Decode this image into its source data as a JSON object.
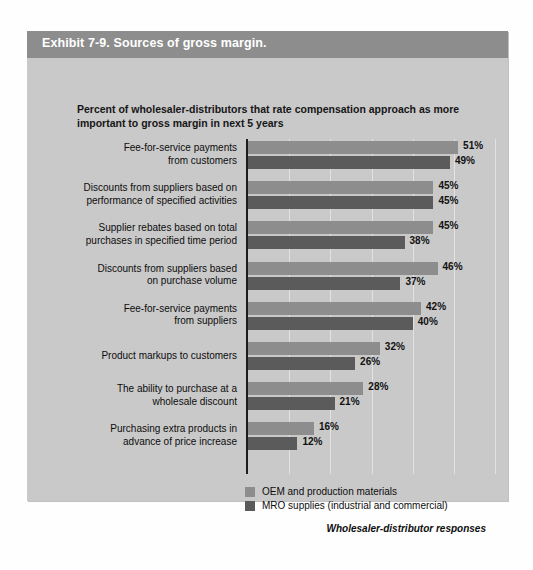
{
  "exhibit": {
    "title": "Exhibit 7-9. Sources of gross margin.",
    "subtitle": "Percent of wholesaler-distributors that rate compensation approach as more important to gross margin in next 5 years",
    "source_note": "Wholesaler-distributor responses"
  },
  "legend": {
    "position": "bottom-left",
    "items": [
      {
        "label": "OEM and production materials",
        "color": "#8d8d8d"
      },
      {
        "label": "MRO supplies (industrial and commercial)",
        "color": "#5b5b5b"
      }
    ]
  },
  "chart_data": {
    "type": "bar",
    "orientation": "horizontal",
    "title": "Exhibit 7-9. Sources of gross margin.",
    "subtitle": "Percent of wholesaler-distributors that rate compensation approach as more important to gross margin in next 5 years",
    "xlabel": "",
    "ylabel": "",
    "xlim": [
      0,
      70
    ],
    "xticks": [
      0,
      10,
      20,
      30,
      40,
      50,
      60
    ],
    "grid": true,
    "value_suffix": "%",
    "legend_position": "bottom-left",
    "categories": [
      "Fee-for-service payments from customers",
      "Discounts from suppliers based on performance of specified activities",
      "Supplier rebates based on total purchases in specified time period",
      "Discounts from suppliers based on purchase volume",
      "Fee-for-service payments from suppliers",
      "Product markups to customers",
      "The ability to purchase at a wholesale discount",
      "Purchasing extra products in advance of price increase"
    ],
    "category_lines": [
      [
        "Fee-for-service payments",
        "from customers"
      ],
      [
        "Discounts from suppliers based on",
        "performance of specified activities"
      ],
      [
        "Supplier rebates based on total",
        "purchases in specified time period"
      ],
      [
        "Discounts from suppliers based",
        "on purchase volume"
      ],
      [
        "Fee-for-service payments",
        "from suppliers"
      ],
      [
        "Product markups to customers"
      ],
      [
        "The ability to purchase at a",
        "wholesale discount"
      ],
      [
        "Purchasing extra products in",
        "advance of price increase"
      ]
    ],
    "series": [
      {
        "name": "OEM and production materials",
        "color": "#8d8d8d",
        "values": [
          51,
          45,
          45,
          46,
          42,
          32,
          28,
          16
        ],
        "labels": [
          "51%",
          "45%",
          "45%",
          "46%",
          "42%",
          "32%",
          "28%",
          "16%"
        ]
      },
      {
        "name": "MRO supplies (industrial and commercial)",
        "color": "#5b5b5b",
        "values": [
          49,
          45,
          38,
          37,
          40,
          26,
          21,
          12
        ],
        "labels": [
          "49%",
          "45%",
          "38%",
          "37%",
          "40%",
          "26%",
          "21%",
          "12%"
        ]
      }
    ]
  }
}
